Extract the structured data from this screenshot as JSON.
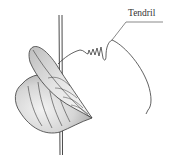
{
  "figure": {
    "labels": [
      {
        "id": "tendril",
        "text": "Tendril"
      }
    ]
  },
  "colors": {
    "line": "#3a3a3a",
    "leaf_shade": "#cfcfcf",
    "leaf_light": "#efefef",
    "background": "#ffffff"
  }
}
